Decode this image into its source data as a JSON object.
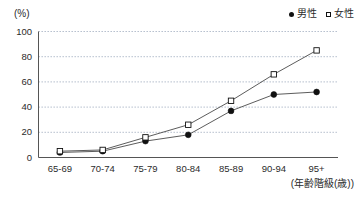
{
  "chart_data": {
    "type": "line",
    "title": "",
    "subtitle": "",
    "xlabel": "(年齢階級(歳))",
    "ylabel": "(%)",
    "categories": [
      "65-69",
      "70-74",
      "75-79",
      "80-84",
      "85-89",
      "90-94",
      "95+"
    ],
    "series": [
      {
        "name": "男性",
        "marker": "filled-circle",
        "color": "#111111",
        "values": [
          4,
          5,
          13,
          18,
          37,
          50,
          52
        ]
      },
      {
        "name": "女性",
        "marker": "open-square",
        "color": "#111111",
        "values": [
          5,
          6,
          16,
          26,
          45,
          66,
          85
        ]
      }
    ],
    "ylim": [
      0,
      100
    ],
    "yticks": [
      0,
      20,
      40,
      60,
      80,
      100
    ],
    "ytick_labels": [
      "0",
      "20",
      "40",
      "60",
      "80",
      "100"
    ],
    "grid": true,
    "grid_axis": "y",
    "grid_style": "dotted",
    "legend_position": "top-right"
  },
  "legend": {
    "items": [
      {
        "label": "男性",
        "marker": "filled-circle"
      },
      {
        "label": "女性",
        "marker": "open-square"
      }
    ]
  },
  "axis": {
    "y_unit": "(%)",
    "x_title": "(年齢階級(歳))"
  },
  "colors": {
    "background": "#ffffff",
    "axis": "#555555",
    "grid": "#9aa7bb",
    "marker": "#111111",
    "line": "#4a4a4a",
    "text": "#2b2b2b"
  }
}
